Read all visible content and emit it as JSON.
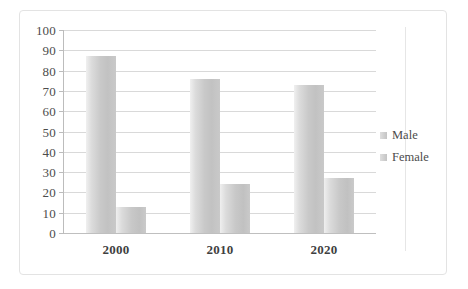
{
  "chart_data": {
    "type": "bar",
    "title": "",
    "subtitle": "",
    "xlabel": "",
    "ylabel": "",
    "categories": [
      "2000",
      "2010",
      "2020"
    ],
    "series": [
      {
        "name": "Male",
        "values": [
          87,
          76,
          73
        ]
      },
      {
        "name": "Female",
        "values": [
          13,
          24,
          27
        ]
      }
    ],
    "ylim": [
      0,
      100
    ],
    "y_ticks": [
      0,
      10,
      20,
      30,
      40,
      50,
      60,
      70,
      80,
      90,
      100
    ],
    "y_tick_labels": [
      "0",
      "10",
      "20",
      "30",
      "40",
      "50",
      "60",
      "70",
      "80",
      "90",
      "100"
    ],
    "grid": true,
    "grid_axis": "y",
    "legend_position": "right",
    "legend_entries": [
      "Male",
      "Female"
    ],
    "colors": {
      "series_male": "#c9c9c9",
      "series_female": "#c8c8c8",
      "gridline": "#d9d9d9",
      "axis": "#bcbcbc",
      "tick_label": "#4c4c4c",
      "category_label": "#3f3f3f",
      "frame_border": "#e3e3e3",
      "background": "#ffffff"
    }
  },
  "legend": {
    "items": [
      {
        "label": "Male",
        "marker": "square-marker"
      },
      {
        "label": "Female",
        "marker": "square-marker"
      }
    ]
  }
}
